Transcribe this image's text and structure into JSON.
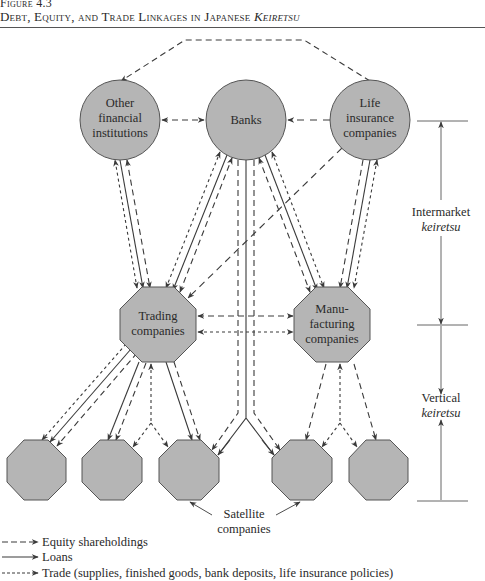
{
  "figure": {
    "label": "Figure 4.3",
    "title_main": "Debt, Equity, and Trade Linkages in Japanese ",
    "title_italic": "Keiretsu"
  },
  "nodes": {
    "other_fi": {
      "lines": [
        "Other",
        "financial",
        "institutions"
      ],
      "shape": "circle"
    },
    "banks": {
      "lines": [
        "Banks"
      ],
      "shape": "circle"
    },
    "life_ins": {
      "lines": [
        "Life",
        "insurance",
        "companies"
      ],
      "shape": "circle"
    },
    "trading": {
      "lines": [
        "Trading",
        "companies"
      ],
      "shape": "octagon"
    },
    "manufacturing": {
      "lines": [
        "Manu-",
        "facturing",
        "companies"
      ],
      "shape": "octagon"
    },
    "satellites": {
      "count": 5,
      "shape": "octagon"
    }
  },
  "labels": {
    "satellite_1": "Satellite",
    "satellite_2": "companies",
    "intermarket_1": "Intermarket",
    "intermarket_2": "keiretsu",
    "vertical_1": "Vertical",
    "vertical_2": "keiretsu"
  },
  "legend": [
    {
      "style": "long-dash",
      "label": "Equity shareholdings"
    },
    {
      "style": "solid",
      "label": "Loans"
    },
    {
      "style": "short-dash",
      "label": "Trade (supplies, finished goods, bank deposits, life insurance policies)"
    }
  ],
  "colors": {
    "node_fill": "#b5b5b5",
    "node_stroke": "#555555",
    "line": "#3a3a3a"
  }
}
